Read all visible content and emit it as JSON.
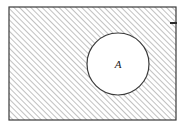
{
  "figure": {
    "kind": "set-diagram",
    "background_color": "#ffffff"
  },
  "outer_region": {
    "name": "hatched-rectangle",
    "stroke_color": "#3a3a3a",
    "fill_pattern": "diagonal-hatch-45",
    "hatch_color": "#8c8c8c",
    "hatch_spacing_px": 4,
    "x": 9,
    "y": 7,
    "width": 167,
    "height": 113
  },
  "inner_region": {
    "name": "circle-A",
    "label": "A",
    "label_color": "#1a1a1a",
    "fill_color": "#ffffff",
    "stroke_color": "#3a3a3a",
    "center_x": 118,
    "center_y": 64,
    "radius": 31
  },
  "boundary_mark": {
    "name": "right-edge-tick",
    "color": "#2b2b2b",
    "x": 170,
    "y": 23,
    "length": 7
  }
}
